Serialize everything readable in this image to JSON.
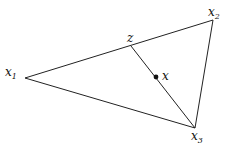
{
  "diagram": {
    "type": "triangle-with-point",
    "stroke_color": "#222222",
    "vertices": [
      {
        "id": "x1",
        "label": "x",
        "subscript": "1",
        "pos": [
          25,
          78
        ]
      },
      {
        "id": "x2",
        "label": "x",
        "subscript": "2",
        "pos": [
          213,
          20
        ]
      },
      {
        "id": "x3",
        "label": "x",
        "subscript": "3",
        "pos": [
          195,
          128
        ]
      }
    ],
    "point_z": {
      "label": "z",
      "pos": [
        131,
        46
      ]
    },
    "point_x": {
      "label": "x",
      "pos": [
        156,
        77
      ]
    },
    "segments": [
      [
        "x1",
        "x2"
      ],
      [
        "x2",
        "x3"
      ],
      [
        "x3",
        "x1"
      ],
      [
        "z",
        "x3"
      ]
    ]
  }
}
